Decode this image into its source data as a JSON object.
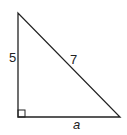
{
  "diagram": {
    "type": "right-triangle",
    "vertices": {
      "top": [
        18,
        13
      ],
      "right_angle": [
        18,
        117
      ],
      "bottom_right": [
        120,
        117
      ]
    },
    "right_angle_marker": {
      "size": 7
    },
    "sides": {
      "vertical_leg": {
        "label": "5",
        "pos": [
          9,
          62
        ]
      },
      "hypotenuse": {
        "label": "7",
        "pos": [
          70,
          64
        ]
      },
      "horizontal_leg": {
        "label": "a",
        "pos": [
          73,
          129
        ]
      }
    },
    "stroke_color": "#222222"
  }
}
